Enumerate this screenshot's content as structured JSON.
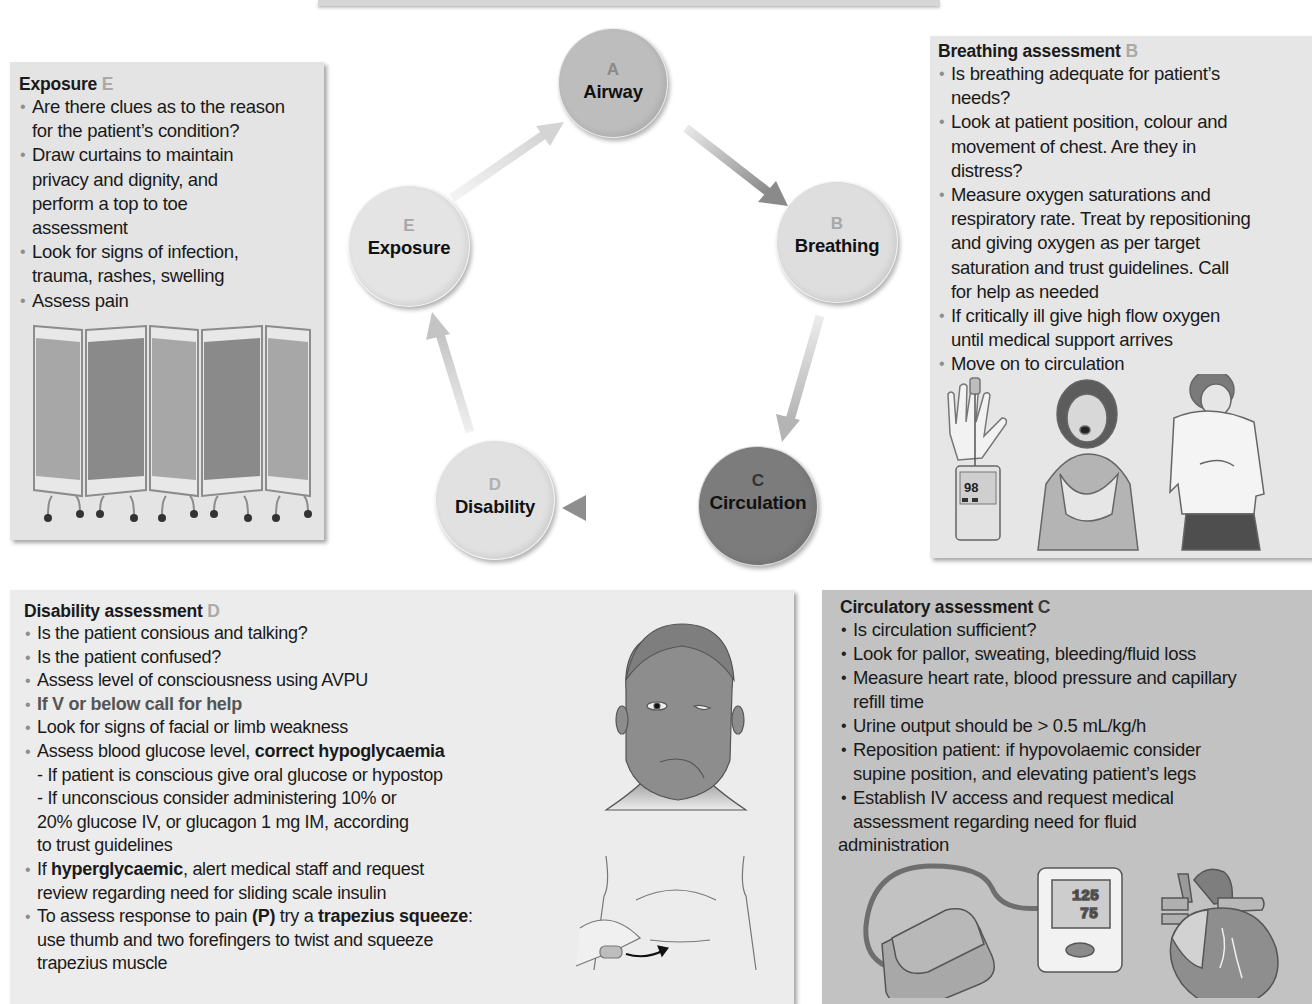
{
  "diagram": {
    "nodes": [
      {
        "letter": "A",
        "label": "Airway"
      },
      {
        "letter": "B",
        "label": "Breathing"
      },
      {
        "letter": "C",
        "label": "Circulation"
      },
      {
        "letter": "D",
        "label": "Disability"
      },
      {
        "letter": "E",
        "label": "Exposure"
      }
    ],
    "flow": [
      "A",
      "B",
      "C",
      "D",
      "E",
      "A"
    ]
  },
  "exposure": {
    "title": "Exposure",
    "letter": "E",
    "bullets": [
      [
        "Are there clues as to the reason",
        "for the patient’s condition?"
      ],
      [
        "Draw curtains to maintain",
        "privacy and dignity, and",
        "perform a top to toe",
        "assessment"
      ],
      [
        "Look for signs of infection,",
        "trauma, rashes, swelling"
      ],
      [
        "Assess pain"
      ]
    ],
    "illustration": "privacy-screen-curtains"
  },
  "breathing": {
    "title": "Breathing assessment",
    "letter": "B",
    "bullets": [
      [
        "Is breathing adequate for patient’s",
        "needs?"
      ],
      [
        "Look at patient position, colour and",
        "movement of chest. Are they in",
        "distress?"
      ],
      [
        "Measure oxygen saturations and",
        "respiratory rate. Treat by repositioning",
        "and giving oxygen as per target",
        "saturation and trust guidelines. Call",
        "for help as needed"
      ],
      [
        "If critically ill give high flow oxygen",
        "until medical support arrives"
      ],
      [
        "Move on to circulation"
      ]
    ],
    "oximeter_reading": "98",
    "illustration": "pulse-oximeter-and-patients-in-distress"
  },
  "disability": {
    "title": "Disability assessment",
    "letter": "D",
    "lines": {
      "b1": "Is the patient consious and talking?",
      "b2": "Is the patient confused?",
      "b3": "Assess level of consciousness using AVPU",
      "b4": "If V or below call for help",
      "b5": "Look for signs of facial or limb weakness",
      "b6_pre": "Assess blood glucose level, ",
      "b6_bold": "correct hypoglycaemia",
      "s1": "- If patient is conscious give oral glucose or hypostop",
      "s2a": "- If unconscious consider administering 10% or",
      "s2b": "20% glucose IV, or glucagon 1 mg IM, according",
      "s2c": "to trust guidelines",
      "b7_pre": "If ",
      "b7_bold": "hyperglycaemic",
      "b7_post": ", alert medical staff and request",
      "b7_line2": "review regarding need for sliding scale insulin",
      "b8_pre": "To assess response to pain ",
      "b8_bold1": "(P)",
      "b8_mid": " try a ",
      "b8_bold2": "trapezius squeeze",
      "b8_post": ":",
      "b8_line2": "use thumb and two forefingers to twist and squeeze",
      "b8_line3": "trapezius muscle"
    },
    "illustration": "facial-droop-and-trapezius-squeeze"
  },
  "circulatory": {
    "title": "Circulatory assessment",
    "letter": "C",
    "bullets": [
      [
        "Is circulation sufficient?"
      ],
      [
        "Look for pallor, sweating, bleeding/fluid loss"
      ],
      [
        "Measure heart rate, blood pressure and capillary",
        "refill time"
      ],
      [
        "Urine output should be > 0.5 mL/kg/h"
      ],
      [
        "Reposition patient: if hypovolaemic consider",
        "supine position, and elevating patient’s legs"
      ],
      [
        "Establish IV access and request medical",
        "assessment regarding need for fluid"
      ]
    ],
    "trailing_line": "administration",
    "bp_reading": {
      "systolic": "125",
      "diastolic": "75"
    },
    "illustration": "blood-pressure-monitor-and-heart"
  },
  "colors": {
    "node_a": "#bdbdbd",
    "node_b": "#dedede",
    "node_c": "#7c7c7c",
    "node_d": "#e1e1e1",
    "node_e": "#e4e4e4",
    "panel_light": "#e6e6e6",
    "panel_circulatory": "#c2c2c2"
  }
}
